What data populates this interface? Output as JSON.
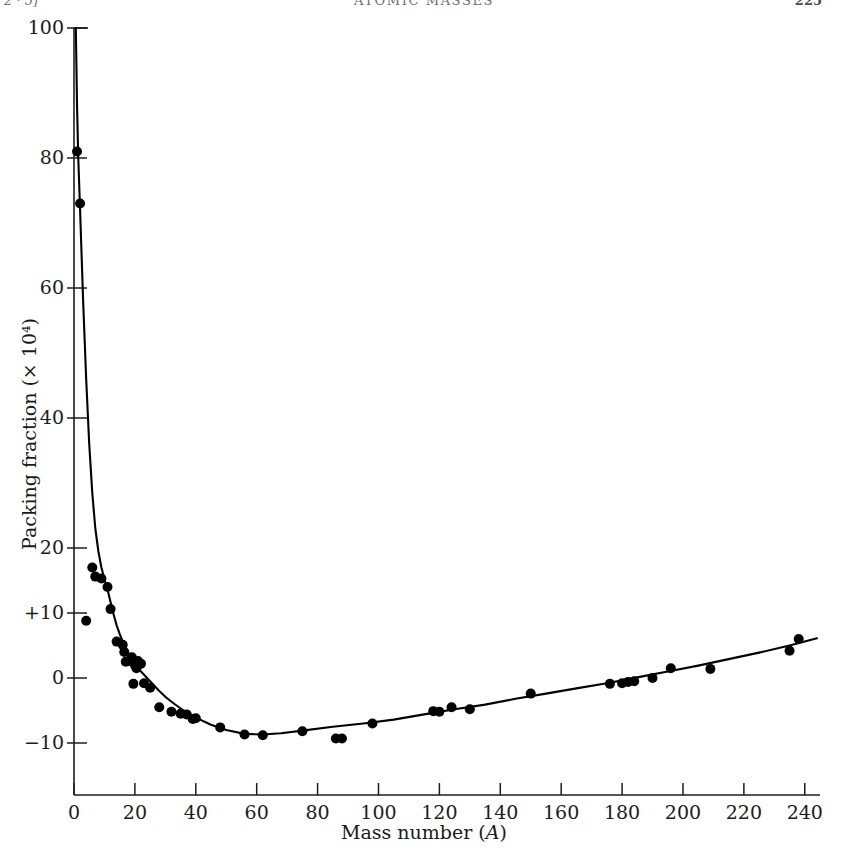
{
  "running_head": {
    "left": "2 · 5]",
    "center": "ATOMIC MASSES",
    "right": "225"
  },
  "chart_data": {
    "type": "scatter",
    "title": "",
    "xlabel": "Mass number (A)",
    "ylabel": "Packing fraction (× 10⁴)",
    "xlim": [
      0,
      245
    ],
    "ylim": [
      -18,
      100
    ],
    "grid": false,
    "legend": null,
    "xticks": [
      0,
      20,
      40,
      60,
      80,
      100,
      120,
      140,
      160,
      180,
      200,
      220,
      240
    ],
    "xticklabels": [
      "0",
      "20",
      "40",
      "60",
      "80",
      "100",
      "120",
      "140",
      "160",
      "180",
      "200",
      "220",
      "240"
    ],
    "yticks": [
      100,
      80,
      60,
      40,
      20,
      10,
      0,
      -10
    ],
    "yticklabels": [
      "100",
      "80",
      "60",
      "40",
      "20",
      "+10",
      "0",
      "−10"
    ],
    "series": [
      {
        "name": "measured nuclides",
        "marker": "filled-circle",
        "color": "#000000",
        "points": [
          [
            1,
            81.0
          ],
          [
            2,
            73.0
          ],
          [
            4,
            8.8
          ],
          [
            6,
            17.0
          ],
          [
            7,
            15.6
          ],
          [
            9,
            15.3
          ],
          [
            11,
            14.0
          ],
          [
            12,
            10.6
          ],
          [
            14,
            5.6
          ],
          [
            16,
            5.1
          ],
          [
            16.5,
            4.0
          ],
          [
            18,
            2.6
          ],
          [
            19,
            3.2
          ],
          [
            20,
            2.0
          ],
          [
            20.5,
            1.5
          ],
          [
            21,
            2.6
          ],
          [
            22,
            2.2
          ],
          [
            17,
            2.5
          ],
          [
            19.5,
            -0.9
          ],
          [
            23,
            -0.8
          ],
          [
            25,
            -1.5
          ],
          [
            28,
            -4.5
          ],
          [
            32,
            -5.2
          ],
          [
            35,
            -5.5
          ],
          [
            37,
            -5.6
          ],
          [
            39,
            -6.3
          ],
          [
            40,
            -6.2
          ],
          [
            48,
            -7.6
          ],
          [
            56,
            -8.7
          ],
          [
            62,
            -8.8
          ],
          [
            75,
            -8.2
          ],
          [
            86,
            -9.3
          ],
          [
            88,
            -9.3
          ],
          [
            98,
            -7.0
          ],
          [
            118,
            -5.1
          ],
          [
            120,
            -5.2
          ],
          [
            124,
            -4.5
          ],
          [
            130,
            -4.8
          ],
          [
            150,
            -2.4
          ],
          [
            176,
            -0.9
          ],
          [
            180,
            -0.8
          ],
          [
            182,
            -0.6
          ],
          [
            184,
            -0.5
          ],
          [
            190,
            0.0
          ],
          [
            196,
            1.5
          ],
          [
            209,
            1.4
          ],
          [
            235,
            4.2
          ],
          [
            238,
            6.0
          ]
        ]
      }
    ],
    "fit_curve": {
      "name": "smooth packing-fraction curve",
      "color": "#000000",
      "points": [
        [
          0.6,
          100.0
        ],
        [
          1.0,
          88.0
        ],
        [
          1.4,
          80.0
        ],
        [
          2.0,
          72.0
        ],
        [
          3.0,
          58.0
        ],
        [
          4.0,
          46.0
        ],
        [
          5.0,
          36.0
        ],
        [
          6.0,
          28.5
        ],
        [
          7.0,
          23.0
        ],
        [
          8.0,
          19.5
        ],
        [
          9.0,
          17.0
        ],
        [
          10.0,
          15.2
        ],
        [
          11.0,
          13.6
        ],
        [
          12.0,
          11.7
        ],
        [
          13.0,
          9.8
        ],
        [
          14.0,
          8.1
        ],
        [
          15.0,
          6.8
        ],
        [
          16.0,
          5.6
        ],
        [
          17.0,
          4.6
        ],
        [
          18.0,
          3.7
        ],
        [
          19.0,
          2.9
        ],
        [
          20.0,
          2.2
        ],
        [
          21.0,
          1.6
        ],
        [
          22.0,
          1.0
        ],
        [
          24.0,
          0.0
        ],
        [
          26.0,
          -1.0
        ],
        [
          28.0,
          -2.0
        ],
        [
          30.0,
          -2.9
        ],
        [
          33.0,
          -4.0
        ],
        [
          36.0,
          -5.0
        ],
        [
          40.0,
          -6.1
        ],
        [
          45.0,
          -7.2
        ],
        [
          50.0,
          -8.0
        ],
        [
          56.0,
          -8.6
        ],
        [
          62.0,
          -8.7
        ],
        [
          68.0,
          -8.5
        ],
        [
          75.0,
          -8.1
        ],
        [
          85.0,
          -7.5
        ],
        [
          95.0,
          -7.0
        ],
        [
          105.0,
          -6.4
        ],
        [
          115.0,
          -5.6
        ],
        [
          125.0,
          -4.8
        ],
        [
          135.0,
          -4.1
        ],
        [
          145.0,
          -3.2
        ],
        [
          155.0,
          -2.4
        ],
        [
          165.0,
          -1.6
        ],
        [
          175.0,
          -0.8
        ],
        [
          185.0,
          0.1
        ],
        [
          195.0,
          1.0
        ],
        [
          205.0,
          1.9
        ],
        [
          215.0,
          2.9
        ],
        [
          225.0,
          3.9
        ],
        [
          235.0,
          5.0
        ],
        [
          244.0,
          6.1
        ]
      ]
    }
  }
}
